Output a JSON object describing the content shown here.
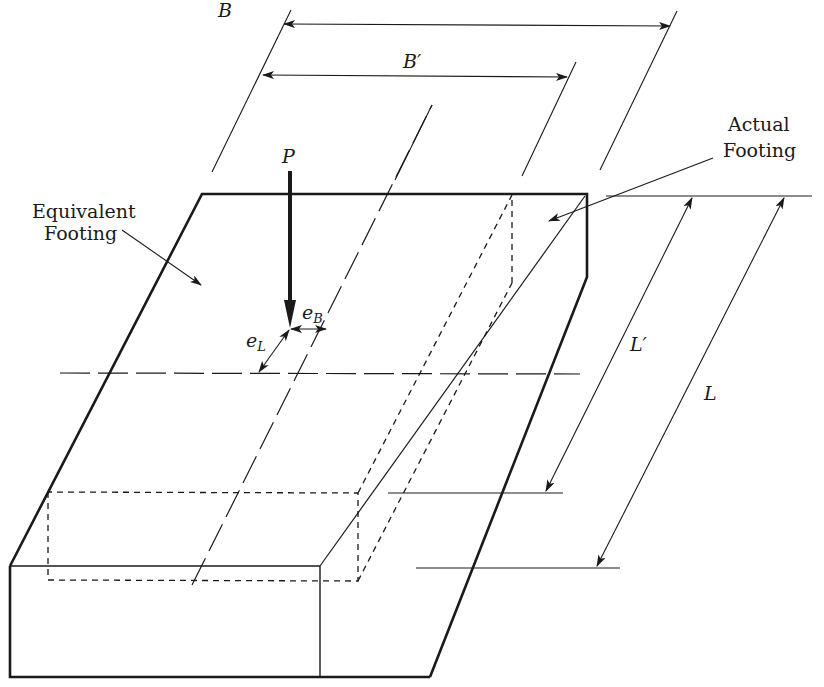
{
  "figure": {
    "background": "#ffffff",
    "stroke_color": "#1a1a1a"
  },
  "labels": {
    "load": "P",
    "width_full": "B",
    "width_effective": "B′",
    "length_full": "L",
    "length_effective": "L′",
    "ecc_b_base": "e",
    "ecc_b_sub": "B",
    "ecc_l_base": "e",
    "ecc_l_sub": "L",
    "equivalent_line1": "Equivalent",
    "equivalent_line2": "Footing",
    "actual_line1": "Actual",
    "actual_line2": "Footing"
  },
  "dimensions": [
    {
      "name": "B",
      "meaning": "full footing width"
    },
    {
      "name": "B′",
      "meaning": "effective width (B − 2eB)"
    },
    {
      "name": "L",
      "meaning": "full footing length"
    },
    {
      "name": "L′",
      "meaning": "effective length (L − 2eL)"
    },
    {
      "name": "eB",
      "meaning": "load eccentricity along B"
    },
    {
      "name": "eL",
      "meaning": "load eccentricity along L"
    }
  ]
}
